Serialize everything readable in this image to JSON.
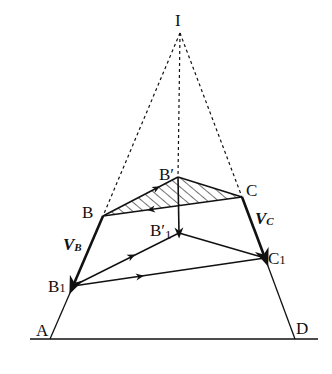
{
  "diagram": {
    "type": "geometric-velocity-construction",
    "colors": {
      "stroke": "#111111",
      "background": "#ffffff"
    },
    "points": {
      "I": {
        "label": "I",
        "x": 180,
        "y": 33
      },
      "A": {
        "label": "A",
        "x": 50,
        "y": 339
      },
      "D": {
        "label": "D",
        "x": 295,
        "y": 339
      },
      "B": {
        "label": "B",
        "x": 103,
        "y": 216
      },
      "C": {
        "label": "C",
        "x": 242,
        "y": 197
      },
      "B'": {
        "label": "B′",
        "x": 178,
        "y": 177
      },
      "B'1": {
        "label": "B′1",
        "x": 179,
        "y": 233
      },
      "B1": {
        "label": "B1",
        "x": 73,
        "y": 286
      },
      "C1": {
        "label": "C1",
        "x": 265,
        "y": 258
      }
    },
    "labels": {
      "I": "I",
      "A": "A",
      "D": "D",
      "B": "B",
      "C": "C",
      "B_prime": "B′",
      "B_prime_1_main": "B′",
      "B_prime_1_sub": "1",
      "B1_main": "B",
      "B1_sub": "1",
      "C1_main": "C",
      "C1_sub": "1",
      "VB_main": "V",
      "VB_sub": "B",
      "VC_main": "V",
      "VC_sub": "C"
    },
    "solid_segments": [
      [
        "A",
        "B"
      ],
      [
        "B",
        "B'"
      ],
      [
        "B'",
        "C"
      ],
      [
        "C",
        "B"
      ],
      [
        "C",
        "D"
      ],
      [
        "B'",
        "B'1"
      ],
      [
        "B1",
        "B'1"
      ],
      [
        "B'1",
        "C1"
      ],
      [
        "B1",
        "C1"
      ]
    ],
    "dashed_segments": [
      [
        "I",
        "B"
      ],
      [
        "I",
        "C"
      ],
      [
        "I",
        "B'"
      ]
    ],
    "hatched_region": [
      "B",
      "B'",
      "C"
    ],
    "arrows": [
      {
        "on": "B-B'",
        "direction": "toward B'"
      },
      {
        "on": "C-B",
        "direction": "toward B"
      },
      {
        "on": "B'-B'1",
        "direction": "down"
      },
      {
        "on": "B-B1",
        "direction": "toward B1",
        "name": "V_B"
      },
      {
        "on": "C-C1",
        "direction": "toward C1",
        "name": "V_C"
      },
      {
        "on": "B1-B'1",
        "direction": "toward B'1"
      },
      {
        "on": "B1-C1",
        "direction": "toward C1"
      }
    ],
    "baseline": {
      "from_x": 30,
      "to_x": 318,
      "y": 339
    }
  }
}
